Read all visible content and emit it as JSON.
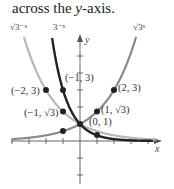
{
  "caption": {
    "prefix": "across the ",
    "var": "y",
    "suffix": "-axis."
  },
  "chart_data": {
    "type": "line",
    "title": "",
    "xlabel": "x",
    "ylabel": "y",
    "xlim": [
      -4,
      4.6
    ],
    "ylim": [
      -2,
      6.2
    ],
    "grid": false,
    "tick_spacing": 1,
    "series": [
      {
        "name": "√3^(-x)",
        "label": "√3⁻ˣ",
        "color": "#b5b5b5",
        "formula": "sqrt(3)^(-x)"
      },
      {
        "name": "3^(-x)",
        "label": "3⁻ˣ",
        "color": "#222222",
        "formula": "3^(-x)"
      },
      {
        "name": "√3^x",
        "label": "√3ˣ",
        "color": "#8a8a8a",
        "formula": "sqrt(3)^x"
      }
    ],
    "points": [
      {
        "x": -2,
        "y": 3,
        "label": "(−2, 3)"
      },
      {
        "x": -1,
        "y": 3,
        "label": "(−1, 3)"
      },
      {
        "x": -1,
        "y": 1.732,
        "label": "(−1, √3)"
      },
      {
        "x": 0,
        "y": 1,
        "label": "(0, 1)"
      },
      {
        "x": 1,
        "y": 1.732,
        "label": "(1, √3)"
      },
      {
        "x": 2,
        "y": 3,
        "label": "(2, 3)"
      },
      {
        "x": -1,
        "y": 0.577,
        "label": ""
      },
      {
        "x": 1,
        "y": 0.333,
        "label": ""
      }
    ],
    "annotations": [
      "√3⁻ˣ",
      "3⁻ˣ",
      "√3ˣ",
      "(−2, 3)",
      "(−1, 3)",
      "(−1, √3)",
      "(0, 1)",
      "(1, √3)",
      "(2, 3)"
    ]
  },
  "labels": {
    "f1": "√3⁻ˣ",
    "f2": "3⁻ˣ",
    "f3": "√3ˣ",
    "x_axis": "x",
    "y_axis": "y",
    "p_m2_3": "(−2, 3)",
    "p_m1_3": "(−1, 3)",
    "p_m1_r3": "(−1, √3)",
    "p_0_1": "(0, 1)",
    "p_1_r3": "(1, √3)",
    "p_2_3": "(2, 3)"
  }
}
